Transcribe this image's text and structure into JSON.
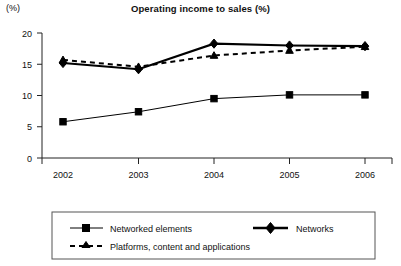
{
  "chart_data": {
    "type": "line",
    "title": "Operating income to sales (%)",
    "ylabel": "(%)",
    "xlabel": "",
    "categories": [
      "2002",
      "2003",
      "2004",
      "2005",
      "2006"
    ],
    "ylim": [
      0,
      20
    ],
    "yticks": [
      0,
      5,
      10,
      15,
      20
    ],
    "ytick_labels": [
      "0",
      "5",
      "10",
      "15",
      "20"
    ],
    "grid": false,
    "legend_position": "bottom",
    "series": [
      {
        "name": "Networked elements",
        "marker": "square",
        "line_style": "solid-thin",
        "values": [
          5.8,
          7.4,
          9.5,
          10.1,
          10.1
        ]
      },
      {
        "name": "Networks",
        "marker": "diamond",
        "line_style": "solid-thick",
        "values": [
          15.2,
          14.2,
          18.3,
          18.0,
          17.9
        ]
      },
      {
        "name": "Platforms, content and applications",
        "marker": "triangle",
        "line_style": "dashed",
        "values": [
          15.7,
          14.6,
          16.4,
          17.2,
          17.8
        ]
      }
    ]
  },
  "legend": {
    "entries": [
      {
        "label": "Networked elements"
      },
      {
        "label": "Networks"
      },
      {
        "label": "Platforms, content and applications"
      }
    ]
  },
  "colors": {
    "ink": "#000000",
    "axis": "#222222",
    "legend_border": "#555555",
    "background": "#ffffff"
  }
}
